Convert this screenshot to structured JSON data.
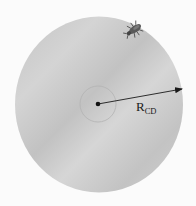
{
  "figure": {
    "radius_label": {
      "main": "R",
      "subscript": "CD"
    },
    "colors": {
      "background": "#fbfbfb",
      "disc": "#c9c9c9",
      "disc_light": "#d8d8d8",
      "inner_ring": "#b5b5b5",
      "arrow": "#1a1a1a",
      "bug": "#4a4a4a"
    }
  }
}
